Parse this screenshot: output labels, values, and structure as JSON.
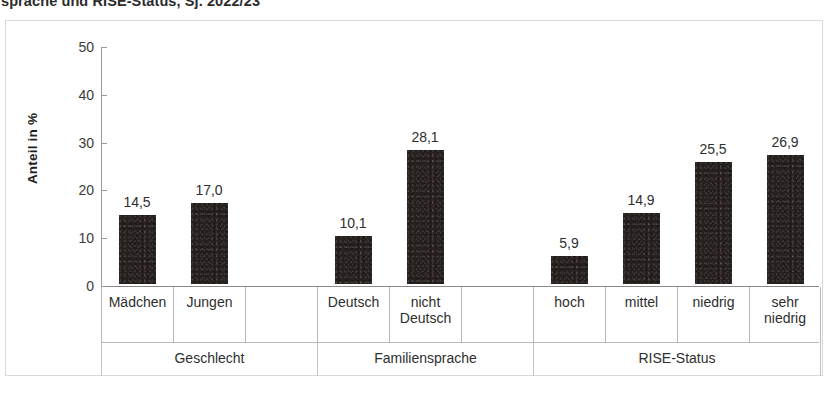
{
  "title": {
    "clipped_text": "sprache und RISE-Status, Sj. 2022/23"
  },
  "footer": {
    "ghost_text": ""
  },
  "chart_data": {
    "type": "bar",
    "title": "sprache und RISE-Status, Sj. 2022/23",
    "xlabel": "",
    "ylabel": "Anteil in %",
    "ylim": [
      0,
      50
    ],
    "yticks": [
      0,
      10,
      20,
      30,
      40,
      50
    ],
    "ytick_labels": [
      "0",
      "10",
      "20",
      "30",
      "40",
      "50"
    ],
    "grid": false,
    "legend": "none",
    "bar_color": "#26211f",
    "categories": [
      "Mädchen",
      "Jungen",
      "Deutsch",
      "nicht Deutsch",
      "hoch",
      "mittel",
      "niedrig",
      "sehr niedrig"
    ],
    "values": [
      14.5,
      17.0,
      10.1,
      28.1,
      5.9,
      14.9,
      25.5,
      26.9
    ],
    "value_labels": [
      "14,5",
      "17,0",
      "10,1",
      "28,1",
      "5,9",
      "14,9",
      "25,5",
      "26,9"
    ],
    "groups": [
      {
        "label": "Geschlecht",
        "categories": [
          "Mädchen",
          "Jungen"
        ]
      },
      {
        "label": "Familiensprache",
        "categories": [
          "Deutsch",
          "nicht Deutsch"
        ]
      },
      {
        "label": "RISE-Status",
        "categories": [
          "hoch",
          "mittel",
          "niedrig",
          "sehr niedrig"
        ]
      }
    ],
    "bars": [
      {
        "group": "Geschlecht",
        "category": "Mädchen",
        "label_line1": "Mädchen",
        "label_line2": "",
        "value": 14.5,
        "value_label": "14,5"
      },
      {
        "group": "Geschlecht",
        "category": "Jungen",
        "label_line1": "Jungen",
        "label_line2": "",
        "value": 17.0,
        "value_label": "17,0"
      },
      {
        "group": "Familiensprache",
        "category": "Deutsch",
        "label_line1": "Deutsch",
        "label_line2": "",
        "value": 10.1,
        "value_label": "10,1"
      },
      {
        "group": "Familiensprache",
        "category": "nicht Deutsch",
        "label_line1": "nicht",
        "label_line2": "Deutsch",
        "value": 28.1,
        "value_label": "28,1"
      },
      {
        "group": "RISE-Status",
        "category": "hoch",
        "label_line1": "hoch",
        "label_line2": "",
        "value": 5.9,
        "value_label": "5,9"
      },
      {
        "group": "RISE-Status",
        "category": "mittel",
        "label_line1": "mittel",
        "label_line2": "",
        "value": 14.9,
        "value_label": "14,9"
      },
      {
        "group": "RISE-Status",
        "category": "niedrig",
        "label_line1": "niedrig",
        "label_line2": "",
        "value": 25.5,
        "value_label": "25,5"
      },
      {
        "group": "RISE-Status",
        "category": "sehr niedrig",
        "label_line1": "sehr",
        "label_line2": "niedrig",
        "value": 26.9,
        "value_label": "26,9"
      }
    ]
  }
}
